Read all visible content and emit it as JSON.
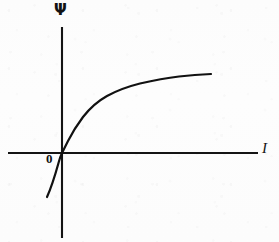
{
  "figure": {
    "kind": "line-plot",
    "background_color": "#fdfdfd",
    "ink_color": "#121212"
  },
  "labels": {
    "y_axis": "Ψ",
    "x_axis": "I",
    "origin": "0"
  },
  "chart_data": {
    "type": "line",
    "title": "",
    "subtitle": "",
    "xlabel": "I",
    "ylabel": "Ψ",
    "legend": [],
    "legend_position": "none",
    "grid": false,
    "axes": {
      "x_axis_drawn_from_px": 8,
      "x_axis_drawn_to_px": 258,
      "y_axis_drawn_from_px": 27,
      "y_axis_drawn_to_px": 238,
      "origin_px": [
        62,
        153
      ]
    },
    "xlim": [
      -0.35,
      2.1
    ],
    "ylim": [
      -0.75,
      1.3
    ],
    "annotations": [
      {
        "text": "0",
        "at": "origin",
        "style": "bold"
      },
      {
        "text": "Ψ",
        "at": "y-axis-top",
        "style": "bold"
      },
      {
        "text": "I",
        "at": "x-axis-right",
        "style": "italic"
      }
    ],
    "series": [
      {
        "name": "Psi(I)",
        "description": "Saturating flux-linkage curve through the origin, steep near zero and flattening at large current; continues into the third quadrant.",
        "x": [
          -0.3,
          -0.26,
          -0.21,
          -0.16,
          -0.11,
          -0.06,
          -0.02,
          0.0,
          0.05,
          0.11,
          0.18,
          0.26,
          0.36,
          0.48,
          0.62,
          0.78,
          0.96,
          1.16,
          1.38,
          1.58,
          1.78,
          1.95,
          2.05
        ],
        "y": [
          -0.72,
          -0.63,
          -0.54,
          -0.45,
          -0.35,
          -0.21,
          -0.08,
          0.0,
          0.17,
          0.3,
          0.4,
          0.48,
          0.56,
          0.63,
          0.7,
          0.76,
          0.81,
          0.86,
          0.9,
          0.93,
          0.96,
          0.98,
          0.99
        ],
        "color": "#111111"
      }
    ]
  },
  "geometry": {
    "curve_path": "M 47 197 C 52 186 56 172 58.5 163 C 60 157.5 61 155 62 153 C 63.5 150 65.5 146 68 141 C 72 133 77 125 83 117 C 90 108 98 101 107 96 C 117 90.5 128 86.5 140 83.5 C 153 80.5 166 78 179 76.5 C 190 75.2 201 74.4 211 74",
    "x_axis_path": "M 8 153 L 258 153",
    "y_axis_path": "M 62 238 L 62 27"
  }
}
